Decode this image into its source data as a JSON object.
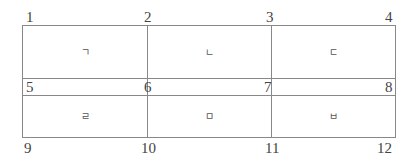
{
  "diagram": {
    "type": "grid",
    "rows": 2,
    "cols": 3,
    "points": [
      {
        "id": "p1",
        "label": "1"
      },
      {
        "id": "p2",
        "label": "2"
      },
      {
        "id": "p3",
        "label": "3"
      },
      {
        "id": "p4",
        "label": "4"
      },
      {
        "id": "p5",
        "label": "5"
      },
      {
        "id": "p6",
        "label": "6"
      },
      {
        "id": "p7",
        "label": "7"
      },
      {
        "id": "p8",
        "label": "8"
      },
      {
        "id": "p9",
        "label": "9"
      },
      {
        "id": "p10",
        "label": "10"
      },
      {
        "id": "p11",
        "label": "11"
      },
      {
        "id": "p12",
        "label": "12"
      }
    ],
    "cells": [
      {
        "label": "ㄱ"
      },
      {
        "label": "ㄴ"
      },
      {
        "label": "ㄷ"
      },
      {
        "label": "ㄹ"
      },
      {
        "label": "ㅁ"
      },
      {
        "label": "ㅂ"
      }
    ],
    "colors": {
      "line": "#888888",
      "text": "#444444"
    }
  }
}
